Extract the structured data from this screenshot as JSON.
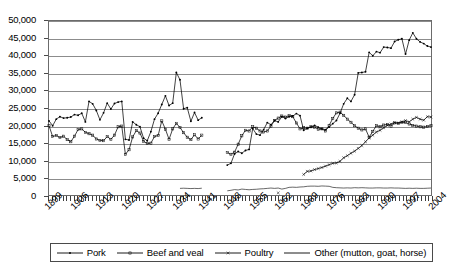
{
  "chart_data": {
    "type": "line",
    "title": "",
    "subtitle": "",
    "xlabel": "",
    "ylabel": "",
    "xlim": [
      1899,
      2004
    ],
    "ylim": [
      0,
      50000
    ],
    "grid": true,
    "grid_axis": "y",
    "legend_position": "bottom",
    "y_ticks": [
      0,
      5000,
      10000,
      15000,
      20000,
      25000,
      30000,
      35000,
      40000,
      45000,
      50000
    ],
    "y_tick_labels": [
      "0",
      "5,000",
      "10,000",
      "15,000",
      "20,000",
      "25,000",
      "30,000",
      "35,000",
      "40,000",
      "45,000",
      "50,000"
    ],
    "x_ticks": [
      1899,
      1906,
      1913,
      1920,
      1927,
      1934,
      1941,
      1948,
      1955,
      1962,
      1969,
      1976,
      1983,
      1990,
      1997,
      2004
    ],
    "x_tick_labels": [
      "1899",
      "1906",
      "1913",
      "1920",
      "1927",
      "1934",
      "1941",
      "1948",
      "1955",
      "1962",
      "1969",
      "1976",
      "1983",
      "1990",
      "1997",
      "2004"
    ],
    "x_minor_tick_interval": 1,
    "series": [
      {
        "name": "Pork",
        "marker": "dot",
        "color": "#000000",
        "x": [
          1899,
          1900,
          1901,
          1902,
          1903,
          1904,
          1905,
          1906,
          1907,
          1908,
          1909,
          1910,
          1911,
          1912,
          1913,
          1914,
          1915,
          1916,
          1917,
          1918,
          1919,
          1920,
          1921,
          1922,
          1923,
          1924,
          1925,
          1926,
          1927,
          1928,
          1929,
          1930,
          1931,
          1932,
          1933,
          1934,
          1935,
          1936,
          1937,
          1938,
          1939,
          1940,
          1941,
          1948,
          1949,
          1950,
          1951,
          1952,
          1953,
          1954,
          1955,
          1956,
          1957,
          1958,
          1959,
          1960,
          1961,
          1962,
          1963,
          1964,
          1965,
          1966,
          1967,
          1968,
          1969,
          1970,
          1971,
          1972,
          1973,
          1974,
          1975,
          1976,
          1977,
          1978,
          1979,
          1980,
          1981,
          1982,
          1983,
          1984,
          1985,
          1986,
          1987,
          1988,
          1989,
          1990,
          1991,
          1992,
          1993,
          1994,
          1995,
          1996,
          1997,
          1998,
          1999,
          2000,
          2001,
          2002,
          2003,
          2004
        ],
        "values": [
          21300,
          19900,
          21800,
          22500,
          22100,
          22200,
          22400,
          23100,
          22900,
          23500,
          21000,
          26900,
          26200,
          24300,
          21600,
          23600,
          26400,
          24700,
          26300,
          26700,
          26900,
          16000,
          15800,
          21000,
          20200,
          19600,
          16300,
          15600,
          18200,
          21800,
          23500,
          26000,
          28500,
          25700,
          26400,
          35200,
          33100,
          24800,
          25100,
          21200,
          23700,
          21500,
          22200,
          8600,
          9100,
          11800,
          12500,
          12000,
          12800,
          13100,
          19100,
          17500,
          17200,
          18800,
          20800,
          20200,
          21400,
          21000,
          22500,
          22000,
          22500,
          22700,
          23400,
          22800,
          18600,
          19200,
          19500,
          20000,
          19500,
          19000,
          18800,
          19500,
          20500,
          21400,
          23500,
          26200,
          27800,
          26900,
          28800,
          35100,
          35200,
          35400,
          41000,
          40000,
          41200,
          40900,
          42500,
          42400,
          42200,
          44100,
          44600,
          44900,
          40500,
          44500,
          46600,
          44900,
          44000,
          43500,
          42800,
          42500
        ],
        "gap_years": [
          1942,
          1943,
          1944,
          1945,
          1946,
          1947
        ]
      },
      {
        "name": "Beef and veal",
        "marker": "square",
        "color": "#000000",
        "x": [
          1899,
          1900,
          1901,
          1902,
          1903,
          1904,
          1905,
          1906,
          1907,
          1908,
          1909,
          1910,
          1911,
          1912,
          1913,
          1914,
          1915,
          1916,
          1917,
          1918,
          1919,
          1920,
          1921,
          1922,
          1923,
          1924,
          1925,
          1926,
          1927,
          1928,
          1929,
          1930,
          1931,
          1932,
          1933,
          1934,
          1935,
          1936,
          1937,
          1938,
          1939,
          1940,
          1941,
          1948,
          1949,
          1950,
          1951,
          1952,
          1953,
          1954,
          1955,
          1956,
          1957,
          1958,
          1959,
          1960,
          1961,
          1962,
          1963,
          1964,
          1965,
          1966,
          1967,
          1968,
          1969,
          1970,
          1971,
          1972,
          1973,
          1974,
          1975,
          1976,
          1977,
          1978,
          1979,
          1980,
          1981,
          1982,
          1983,
          1984,
          1985,
          1986,
          1987,
          1988,
          1989,
          1990,
          1991,
          1992,
          1993,
          1994,
          1995,
          1996,
          1997,
          1998,
          1999,
          2000,
          2001,
          2002,
          2003,
          2004
        ],
        "values": [
          19900,
          16800,
          17100,
          16500,
          16900,
          15900,
          15300,
          16900,
          18800,
          19000,
          18000,
          17600,
          17200,
          16100,
          15700,
          15600,
          16800,
          16000,
          17200,
          19600,
          19800,
          11700,
          13000,
          16700,
          18500,
          17800,
          15400,
          14800,
          14900,
          16800,
          17100,
          21300,
          18900,
          16000,
          19000,
          20600,
          19400,
          17900,
          16600,
          15900,
          17300,
          16100,
          17200,
          12200,
          11700,
          12300,
          14600,
          17000,
          18600,
          18400,
          19600,
          19200,
          18400,
          18100,
          18400,
          19800,
          21400,
          22100,
          22700,
          22400,
          22800,
          22500,
          20700,
          19000,
          19300,
          19200,
          19600,
          19500,
          18900,
          19000,
          18400,
          20000,
          22000,
          23600,
          23800,
          22900,
          21800,
          20900,
          19900,
          19200,
          18700,
          19000,
          16600,
          18300,
          19900,
          19600,
          20100,
          20300,
          19800,
          20700,
          20600,
          20900,
          20800,
          20400,
          20000,
          19800,
          19600,
          19500,
          19700,
          19900
        ],
        "gap_years": [
          1942,
          1943,
          1944,
          1945,
          1946,
          1947
        ]
      },
      {
        "name": "Poultry",
        "marker": "cross",
        "color": "#000000",
        "x": [
          1962,
          1969,
          1970,
          1971,
          1972,
          1973,
          1974,
          1975,
          1976,
          1977,
          1978,
          1979,
          1980,
          1981,
          1982,
          1983,
          1984,
          1985,
          1986,
          1987,
          1988,
          1989,
          1990,
          1991,
          1992,
          1993,
          1994,
          1995,
          1996,
          1997,
          1998,
          1999,
          2000,
          2001,
          2002,
          2003,
          2004
        ],
        "values": [
          600,
          5900,
          6800,
          6900,
          7300,
          7600,
          7900,
          8300,
          8700,
          9100,
          9200,
          9700,
          10700,
          11300,
          12000,
          12600,
          13400,
          14200,
          15300,
          16400,
          17200,
          18100,
          18600,
          19300,
          20000,
          20400,
          20800,
          20700,
          21000,
          21400,
          21000,
          21800,
          22300,
          21800,
          21500,
          22500,
          22400
        ],
        "gap_years": [
          1963,
          1964,
          1965,
          1966,
          1967,
          1968
        ]
      },
      {
        "name": "Other (mutton, goat, horse)",
        "marker": "none",
        "color": "#000000",
        "x": [
          1935,
          1936,
          1937,
          1938,
          1939,
          1940,
          1941,
          1948,
          1949,
          1950,
          1951,
          1952,
          1953,
          1954,
          1955,
          1956,
          1957,
          1958,
          1959,
          1960,
          1961,
          1962,
          1963,
          1964,
          1965,
          1966,
          1967,
          1968,
          1969,
          1970,
          1971,
          1972,
          1973,
          1974,
          1975,
          1976,
          1977,
          1978,
          1979,
          1980,
          1981,
          1982,
          1983,
          1984,
          1985,
          1986,
          1987,
          1988,
          1989,
          1990,
          1991,
          1992,
          1993,
          1994,
          1995,
          1996,
          1997,
          1998,
          1999,
          2000,
          2001,
          2002,
          2003,
          2004
        ],
        "values": [
          1900,
          1950,
          1900,
          1850,
          1900,
          1850,
          1950,
          1200,
          1350,
          1550,
          1450,
          1700,
          1600,
          1500,
          1600,
          1650,
          1750,
          1800,
          1900,
          2000,
          1900,
          2000,
          1700,
          1900,
          2200,
          2250,
          2200,
          2300,
          2350,
          2500,
          2550,
          2550,
          2500,
          2600,
          2550,
          2500,
          2200,
          2100,
          2050,
          2000,
          2050,
          2000,
          2100,
          2050,
          2100,
          2050,
          2000,
          2000,
          2050,
          2050,
          2000,
          2000,
          2050,
          2000,
          2000,
          1950,
          1900,
          1950,
          1900,
          1950,
          1900,
          1900,
          1950,
          2000
        ],
        "gap_years": [
          1942,
          1943,
          1944,
          1945,
          1946,
          1947
        ]
      }
    ]
  },
  "legend": {
    "items": [
      {
        "label": "Pork",
        "marker": "dot"
      },
      {
        "label": "Beef and veal",
        "marker": "square"
      },
      {
        "label": "Poultry",
        "marker": "cross"
      },
      {
        "label": "Other (mutton, goat, horse)",
        "marker": "none"
      }
    ]
  },
  "colors": {
    "series_line": "#000000",
    "gridline": "#8c8c8c",
    "axis": "#6b6b6b",
    "background": "#ffffff"
  }
}
